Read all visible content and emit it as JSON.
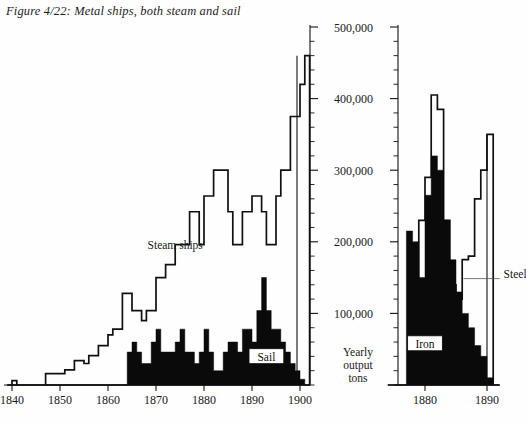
{
  "figure": {
    "caption": "Figure 4/22: Metal ships, both steam and sail",
    "y_axis_caption_lines": [
      "Yearly",
      "output",
      "tons"
    ]
  },
  "annotations": {
    "steam_ships": "Steam ships",
    "sail": "Sail",
    "iron": "Iron",
    "steel": "Steel"
  },
  "colors": {
    "ink": "#111111",
    "fill": "#0a0a0a",
    "paper": "#fefefe",
    "leader": "#555555"
  },
  "chart_data": {
    "type": "area",
    "title": "Figure 4/22: Metal ships, both steam and sail",
    "xlabel": "",
    "ylabel": "Yearly output tons",
    "ylim": [
      0,
      500000
    ],
    "y_ticks": [
      100000,
      200000,
      300000,
      400000,
      500000
    ],
    "y_tick_labels": [
      "100,000",
      "200,000",
      "300,000",
      "400,000",
      "500,000"
    ],
    "y_minor_tick_step": 20000,
    "grid": false,
    "legend": "inline-annotations",
    "panels": [
      {
        "name": "ships",
        "xlim": [
          1839,
          1902
        ],
        "x_ticks": [
          1840,
          1850,
          1860,
          1870,
          1880,
          1890,
          1900
        ],
        "x_tick_labels": [
          "1840",
          "1850",
          "1860",
          "1870",
          "1880",
          "1890",
          "1900"
        ],
        "series": [
          {
            "name": "Steam ships",
            "style": "step-outline",
            "x": [
              1839,
              1840,
              1841,
              1842,
              1843,
              1844,
              1845,
              1846,
              1847,
              1848,
              1849,
              1850,
              1851,
              1852,
              1853,
              1854,
              1855,
              1856,
              1857,
              1858,
              1859,
              1860,
              1861,
              1862,
              1863,
              1864,
              1865,
              1866,
              1867,
              1868,
              1869,
              1870,
              1871,
              1872,
              1873,
              1874,
              1875,
              1876,
              1877,
              1878,
              1879,
              1880,
              1881,
              1882,
              1883,
              1884,
              1885,
              1886,
              1887,
              1888,
              1889,
              1890,
              1891,
              1892,
              1893,
              1894,
              1895,
              1896,
              1897,
              1898,
              1899,
              1900,
              1901
            ],
            "values": [
              0,
              6000,
              0,
              0,
              0,
              0,
              0,
              0,
              16000,
              16000,
              16000,
              16000,
              21000,
              21000,
              34000,
              34000,
              30000,
              41000,
              41000,
              55000,
              55000,
              70000,
              78000,
              78000,
              128000,
              128000,
              104000,
              104000,
              90000,
              104000,
              104000,
              150000,
              150000,
              168000,
              168000,
              196000,
              196000,
              196000,
              242000,
              242000,
              196000,
              264000,
              264000,
              300000,
              300000,
              300000,
              242000,
              196000,
              196000,
              242000,
              242000,
              264000,
              264000,
              242000,
              196000,
              196000,
              264000,
              300000,
              300000,
              375000,
              375000,
              420000,
              460000
            ]
          },
          {
            "name": "Sail",
            "style": "step-filled",
            "x": [
              1839,
              1840,
              1841,
              1842,
              1843,
              1844,
              1845,
              1846,
              1847,
              1848,
              1849,
              1850,
              1851,
              1852,
              1853,
              1854,
              1855,
              1856,
              1857,
              1858,
              1859,
              1860,
              1861,
              1862,
              1863,
              1864,
              1865,
              1866,
              1867,
              1868,
              1869,
              1870,
              1871,
              1872,
              1873,
              1874,
              1875,
              1876,
              1877,
              1878,
              1879,
              1880,
              1881,
              1882,
              1883,
              1884,
              1885,
              1886,
              1887,
              1888,
              1889,
              1890,
              1891,
              1892,
              1893,
              1894,
              1895,
              1896,
              1897,
              1898,
              1899,
              1900,
              1901
            ],
            "values": [
              0,
              0,
              0,
              0,
              0,
              0,
              0,
              0,
              0,
              0,
              0,
              0,
              0,
              0,
              0,
              0,
              0,
              0,
              0,
              0,
              0,
              0,
              0,
              0,
              0,
              46000,
              60000,
              46000,
              30000,
              30000,
              60000,
              78000,
              46000,
              46000,
              46000,
              60000,
              78000,
              46000,
              46000,
              30000,
              46000,
              78000,
              46000,
              20000,
              20000,
              46000,
              60000,
              60000,
              46000,
              78000,
              78000,
              60000,
              104000,
              150000,
              104000,
              78000,
              78000,
              60000,
              46000,
              30000,
              20000,
              8000,
              0
            ]
          }
        ],
        "annotations": [
          {
            "text": "Steam ships",
            "x": 1874,
            "y": 190000,
            "boxed": false
          },
          {
            "text": "Sail",
            "x": 1893,
            "y": 34000,
            "boxed": true
          }
        ]
      },
      {
        "name": "metal-output",
        "xlim": [
          1874,
          1891
        ],
        "x_ticks": [
          1880,
          1890
        ],
        "x_tick_labels": [
          "1880",
          "1890"
        ],
        "series": [
          {
            "name": "Iron",
            "style": "step-filled",
            "x": [
              1874,
              1875,
              1876,
              1877,
              1878,
              1879,
              1880,
              1881,
              1882,
              1883,
              1884,
              1885,
              1886,
              1887,
              1888,
              1889,
              1890,
              1891
            ],
            "values": [
              0,
              0,
              0,
              215000,
              200000,
              150000,
              265000,
              320000,
              300000,
              230000,
              175000,
              130000,
              100000,
              80000,
              55000,
              40000,
              10000,
              0
            ]
          },
          {
            "name": "Steel",
            "style": "step-outline",
            "x": [
              1874,
              1875,
              1876,
              1877,
              1878,
              1879,
              1880,
              1881,
              1882,
              1883,
              1884,
              1885,
              1886,
              1887,
              1888,
              1889,
              1890,
              1891
            ],
            "values": [
              0,
              0,
              0,
              0,
              0,
              230000,
              290000,
              405000,
              385000,
              230000,
              140000,
              120000,
              175000,
              180000,
              260000,
              300000,
              350000,
              0
            ]
          }
        ],
        "annotations": [
          {
            "text": "Iron",
            "x": 1880,
            "y": 52000,
            "boxed": true
          },
          {
            "text": "Steel",
            "x": 1893,
            "y": 150000,
            "boxed": false,
            "leader": true
          }
        ]
      }
    ]
  }
}
